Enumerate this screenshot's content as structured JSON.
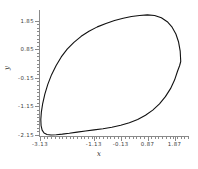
{
  "figure": {
    "background_color": "#ffffff",
    "curve_color": "#111111",
    "axis_color": "#8a8a8a",
    "tick_label_color": "#3a3a3a"
  },
  "axis_titles": {
    "x": "x",
    "y": "y"
  },
  "chart_data": {
    "type": "line",
    "title": "",
    "subtitle": "",
    "xlabel": "x",
    "ylabel": "y",
    "xlim": [
      -3.13,
      2.37
    ],
    "ylim": [
      -2.15,
      2.15
    ],
    "grid": false,
    "legend": null,
    "annotations": [],
    "closed_curve": true,
    "x_ticks": [
      -3.13,
      -1.13,
      -0.13,
      0.87,
      1.87
    ],
    "x_tick_labels": [
      "-3.13",
      "-1.13",
      "-0.13",
      "0.87",
      "1.87"
    ],
    "x_minor_tick_count": 40,
    "y_ticks": [
      1.85,
      0.85,
      -0.15,
      -1.15,
      -2.15
    ],
    "y_tick_labels": [
      "1.85",
      "0.85",
      "-0.15",
      "-1.15",
      "-2.15"
    ],
    "y_minor_tick_count": 32,
    "series": [
      {
        "name": "trajectory",
        "color": "#111111",
        "linewidth": 1.1,
        "x": [
          2.1,
          2.08,
          2.02,
          1.92,
          1.78,
          1.6,
          1.38,
          1.13,
          0.86,
          0.57,
          0.27,
          -0.04,
          -0.36,
          -0.68,
          -1.0,
          -1.31,
          -1.6,
          -1.87,
          -2.12,
          -2.34,
          -2.53,
          -2.7,
          -2.84,
          -2.95,
          -3.03,
          -3.08,
          -3.1,
          -3.09,
          -3.05,
          -2.98,
          -2.87,
          -2.72,
          -2.53,
          -2.3,
          -2.04,
          -1.75,
          -1.44,
          -1.12,
          -0.79,
          -0.46,
          -0.13,
          0.19,
          0.5,
          0.79,
          1.06,
          1.31,
          1.53,
          1.72,
          1.87,
          1.98,
          2.06,
          2.1
        ],
        "y": [
          0.42,
          0.78,
          1.1,
          1.38,
          1.62,
          1.81,
          1.95,
          2.03,
          2.05,
          2.03,
          1.99,
          1.93,
          1.85,
          1.75,
          1.63,
          1.48,
          1.3,
          1.09,
          0.85,
          0.58,
          0.28,
          -0.04,
          -0.38,
          -0.72,
          -1.05,
          -1.35,
          -1.61,
          -1.82,
          -1.98,
          -2.08,
          -2.13,
          -2.15,
          -2.14,
          -2.12,
          -2.09,
          -2.05,
          -2.01,
          -1.97,
          -1.93,
          -1.88,
          -1.81,
          -1.72,
          -1.61,
          -1.46,
          -1.28,
          -1.06,
          -0.81,
          -0.53,
          -0.23,
          0.08,
          0.28,
          0.42
        ]
      }
    ]
  }
}
